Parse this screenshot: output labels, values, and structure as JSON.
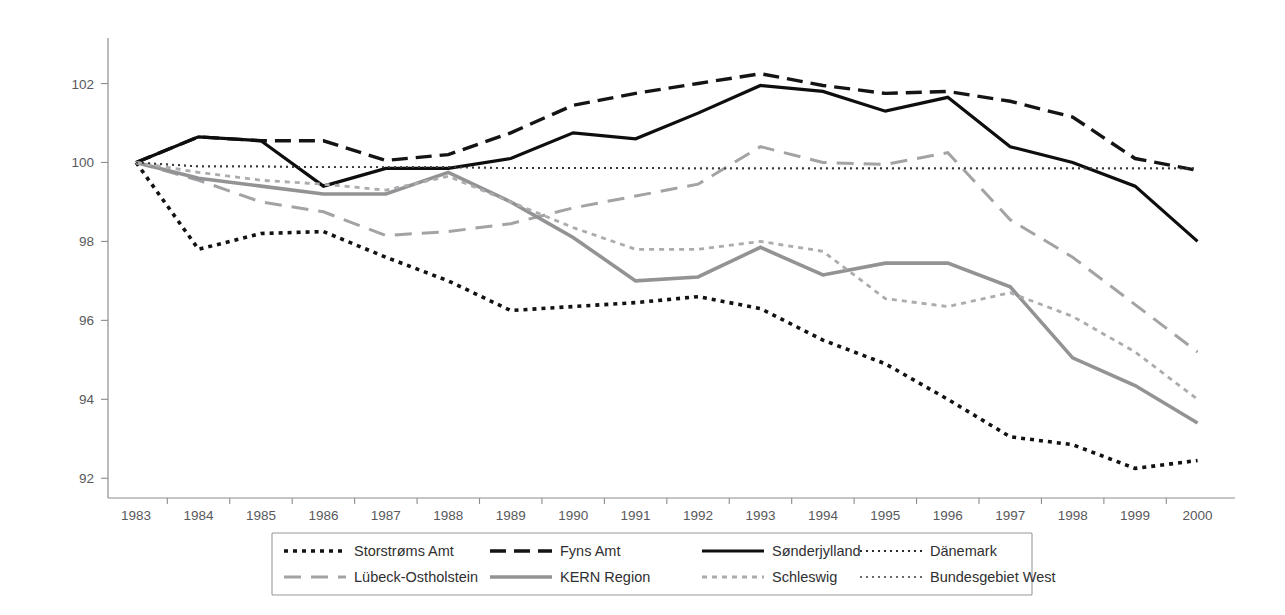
{
  "chart_data": {
    "type": "line",
    "title": "",
    "subtitle": "",
    "xlabel": "",
    "ylabel": "",
    "x": [
      1983,
      1984,
      1985,
      1986,
      1987,
      1988,
      1989,
      1990,
      1991,
      1992,
      1993,
      1994,
      1995,
      1996,
      1997,
      1998,
      1999,
      2000
    ],
    "xticklabels": [
      "1983",
      "1984",
      "1985",
      "1986",
      "1987",
      "1988",
      "1989",
      "1990",
      "1991",
      "1992",
      "1993",
      "1994",
      "1995",
      "1996",
      "1997",
      "1998",
      "1999",
      "2000"
    ],
    "yticklabels": [
      "92",
      "94",
      "96",
      "98",
      "100",
      "102"
    ],
    "yticks": [
      92,
      94,
      96,
      98,
      100,
      102
    ],
    "ylim": [
      91.5,
      102.9
    ],
    "xlim": [
      1982.55,
      2000.6
    ],
    "grid": false,
    "legend_position": "bottom",
    "legend_columns": 4,
    "series": [
      {
        "name": "Storstrøms Amt",
        "style": "dotted-thick",
        "color": "#121212",
        "dash": "4,5",
        "width": 3.6,
        "values": [
          100.0,
          97.8,
          98.2,
          98.25,
          97.6,
          97.0,
          96.25,
          96.35,
          96.45,
          96.6,
          96.3,
          95.5,
          94.9,
          94.0,
          93.05,
          92.85,
          92.25,
          92.45
        ]
      },
      {
        "name": "Fyns Amt",
        "style": "dashed-thick",
        "color": "#141414",
        "dash": "16,8",
        "width": 3.4,
        "values": [
          100.0,
          100.65,
          100.55,
          100.55,
          100.05,
          100.2,
          100.75,
          101.45,
          101.75,
          102.0,
          102.25,
          101.95,
          101.75,
          101.8,
          101.55,
          101.15,
          100.1,
          99.8
        ]
      },
      {
        "name": "Sønderjylland",
        "style": "solid-thick",
        "color": "#0e0e0e",
        "dash": "none",
        "width": 3.2,
        "values": [
          100.0,
          100.65,
          100.55,
          99.4,
          99.85,
          99.85,
          100.1,
          100.75,
          100.6,
          101.25,
          101.95,
          101.8,
          101.3,
          101.65,
          100.4,
          100.0,
          99.4,
          98.0
        ]
      },
      {
        "name": "Dänemark",
        "style": "dotted-fine",
        "color": "#2b2b2b",
        "dash": "2,4",
        "width": 1.8,
        "values": [
          100.0,
          99.9,
          99.9,
          99.88,
          99.88,
          99.88,
          99.86,
          99.86,
          99.86,
          99.85,
          99.85,
          99.85,
          99.85,
          99.85,
          99.85,
          99.85,
          99.85,
          99.85
        ]
      },
      {
        "name": "Lübeck-Ostholstein",
        "style": "dashed-long-grey",
        "color": "#a3a3a5",
        "dash": "17,10",
        "width": 3.0,
        "values": [
          100.0,
          99.55,
          99.0,
          98.75,
          98.15,
          98.25,
          98.45,
          98.85,
          99.15,
          99.45,
          100.4,
          100.0,
          99.95,
          100.25,
          98.55,
          97.6,
          96.4,
          95.2
        ]
      },
      {
        "name": "KERN Region",
        "style": "solid-grey",
        "color": "#939396",
        "dash": "none",
        "width": 3.6,
        "values": [
          100.0,
          99.6,
          99.4,
          99.2,
          99.2,
          99.75,
          99.0,
          98.1,
          97.0,
          97.1,
          97.85,
          97.15,
          97.45,
          97.45,
          96.85,
          95.05,
          94.35,
          93.4
        ]
      },
      {
        "name": "Schleswig",
        "style": "dotted-grey",
        "color": "#acacae",
        "dash": "5,5",
        "width": 2.8,
        "values": [
          100.0,
          99.75,
          99.55,
          99.45,
          99.3,
          99.65,
          99.0,
          98.35,
          97.8,
          97.8,
          98.0,
          97.75,
          96.55,
          96.35,
          96.7,
          96.1,
          95.2,
          94.0
        ]
      },
      {
        "name": "Bundesgebiet West",
        "style": "dotted-fine-grey",
        "color": "#3a3a3a",
        "dash": "2,4",
        "width": 1.6,
        "values": [
          100.0,
          99.9,
          99.9,
          99.88,
          99.88,
          99.88,
          99.86,
          99.86,
          99.86,
          99.85,
          99.85,
          99.85,
          99.85,
          99.85,
          99.85,
          99.85,
          99.85,
          99.85
        ]
      }
    ],
    "legend_entries": [
      {
        "label": "Storstrøms Amt",
        "series_index": 0,
        "row": 0,
        "col": 0
      },
      {
        "label": "Fyns Amt",
        "series_index": 1,
        "row": 0,
        "col": 1
      },
      {
        "label": "Sønderjylland",
        "series_index": 2,
        "row": 0,
        "col": 2
      },
      {
        "label": "Dänemark",
        "series_index": 3,
        "row": 0,
        "col": 3
      },
      {
        "label": "Lübeck-Ostholstein",
        "series_index": 4,
        "row": 1,
        "col": 0
      },
      {
        "label": "KERN Region",
        "series_index": 5,
        "row": 1,
        "col": 1
      },
      {
        "label": "Schleswig",
        "series_index": 6,
        "row": 1,
        "col": 2
      },
      {
        "label": "Bundesgebiet West",
        "series_index": 7,
        "row": 1,
        "col": 3
      }
    ]
  }
}
